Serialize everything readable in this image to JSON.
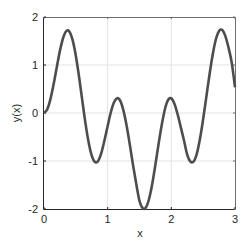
{
  "chart_data": {
    "type": "line",
    "title": "",
    "xlabel": "x",
    "ylabel": "y(x)",
    "xlim": [
      0,
      3
    ],
    "ylim": [
      -2,
      2
    ],
    "xticks": [
      0,
      1,
      2,
      3
    ],
    "xtick_labels": [
      "0",
      "1",
      "2",
      "3"
    ],
    "yticks": [
      -2,
      -1,
      0,
      1,
      2
    ],
    "ytick_labels": [
      "-2",
      "-1",
      "0",
      "1",
      "2"
    ],
    "grid": true,
    "legend": null,
    "series": [
      {
        "name": "y(x)",
        "color": "#4d4d4d",
        "line_width": 2.6,
        "x": [
          0.0,
          0.05,
          0.1,
          0.15,
          0.2,
          0.25,
          0.3,
          0.35,
          0.4,
          0.45,
          0.5,
          0.55,
          0.6,
          0.65,
          0.7,
          0.75,
          0.8,
          0.85,
          0.9,
          0.95,
          1.0,
          1.05,
          1.1,
          1.15,
          1.2,
          1.25,
          1.3,
          1.35,
          1.4,
          1.45,
          1.5,
          1.55,
          1.6,
          1.65,
          1.7,
          1.75,
          1.8,
          1.85,
          1.9,
          1.95,
          2.0,
          2.05,
          2.1,
          2.15,
          2.2,
          2.25,
          2.3,
          2.35,
          2.4,
          2.45,
          2.5,
          2.55,
          2.6,
          2.65,
          2.7,
          2.75,
          2.8,
          2.85,
          2.9,
          2.95,
          3.0
        ],
        "y": [
          0.0,
          0.074,
          0.283,
          0.593,
          0.95,
          1.294,
          1.563,
          1.707,
          1.695,
          1.518,
          1.194,
          0.761,
          0.275,
          -0.201,
          -0.606,
          -0.89,
          -1.022,
          -0.998,
          -0.836,
          -0.57,
          -0.271,
          0.015,
          0.223,
          0.309,
          0.247,
          0.038,
          -0.282,
          -0.678,
          -1.097,
          -1.483,
          -1.834,
          -1.983,
          -1.97,
          -1.791,
          -1.479,
          -1.073,
          -0.643,
          -0.246,
          0.083,
          0.272,
          0.304,
          0.187,
          -0.034,
          -0.304,
          -0.578,
          -0.871,
          -1.012,
          -1.011,
          -0.849,
          -0.538,
          -0.124,
          0.338,
          0.803,
          1.218,
          1.536,
          1.709,
          1.728,
          1.596,
          1.352,
          1.039,
          0.536
        ]
      }
    ]
  },
  "style": {
    "axis_color": "#262626",
    "box_color": "#6e6e6e",
    "grid_color": "#e3e3e3",
    "background": "#ffffff"
  },
  "layout": {
    "plot_left": 44,
    "plot_right": 235,
    "plot_top": 17,
    "plot_bottom": 209
  }
}
